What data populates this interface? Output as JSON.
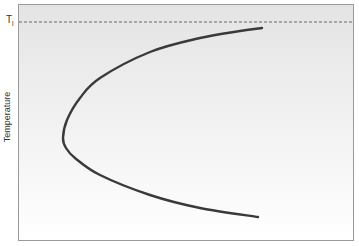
{
  "chart_data": {
    "type": "line",
    "title": "",
    "xlabel": "",
    "ylabel": "Temperature",
    "annotations": [
      {
        "text": "T",
        "subscript": "l",
        "meaning": "reference temperature line (dashed, near top)"
      }
    ],
    "grid": false,
    "legend": null,
    "background_gradient": {
      "top": "#e6e6e6",
      "bottom": "#ffffff"
    },
    "frame": {
      "x0": 18,
      "y0": 4,
      "x1": 354,
      "y1": 241
    },
    "reference_line": {
      "y_px": 22,
      "style": "dashed",
      "color": "#666666"
    },
    "series": [
      {
        "name": "curve",
        "color": "#3a3a3a",
        "points_px": [
          [
            262,
            28
          ],
          [
            240,
            31
          ],
          [
            200,
            38
          ],
          [
            150,
            52
          ],
          [
            100,
            78
          ],
          [
            80,
            98
          ],
          [
            67,
            120
          ],
          [
            63,
            138
          ],
          [
            66,
            148
          ],
          [
            75,
            158
          ],
          [
            100,
            175
          ],
          [
            150,
            195
          ],
          [
            200,
            208
          ],
          [
            258,
            217
          ]
        ]
      }
    ]
  },
  "labels": {
    "y_axis": "Temperature",
    "t_main": "T",
    "t_sub": "l"
  }
}
